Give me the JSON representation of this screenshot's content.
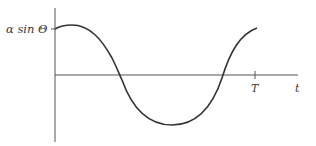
{
  "diagram": {
    "type": "waveform",
    "y_label": "α sin Θ",
    "x_axis_label": "t",
    "period_label": "T",
    "curve": "cosine-like wave starting at α sin Θ, crossing zero, reaching a minimum, and returning to α sin Θ at t = T",
    "colors": {
      "axis": "#555555",
      "curve": "#333333",
      "text": "#3a3a3a"
    }
  }
}
